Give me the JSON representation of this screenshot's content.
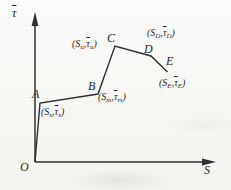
{
  "figure": {
    "ink": "#2f2f2f"
  },
  "axes": {
    "y_label": "τ",
    "x_label": "S",
    "origin_label": "O"
  },
  "curve": {
    "polyline_points": "35,162 40,103 98,94 115,46 151,56 167.5,72"
  },
  "points": [
    {
      "letter": "A",
      "coord_open": "(S",
      "coord_sub1": "s",
      "coord_comma": ",",
      "coord_tau": "τ",
      "coord_sub2": "s",
      "coord_close": ")"
    },
    {
      "letter": "B",
      "coord_open": "(S",
      "coord_sub1": "m",
      "coord_comma": ",",
      "coord_tau": "τ",
      "coord_sub2": "m",
      "coord_close": ")"
    },
    {
      "letter": "C",
      "coord_open": "(S",
      "coord_sub1": "u",
      "coord_comma": ",",
      "coord_tau": "τ",
      "coord_sub2": "u",
      "coord_close": ")"
    },
    {
      "letter": "D",
      "coord_open": "(S",
      "coord_sub1": "D",
      "coord_comma": ",",
      "coord_tau": "τ",
      "coord_sub2": "D",
      "coord_close": ")"
    },
    {
      "letter": "E",
      "coord_open": "(S",
      "coord_sub1": "E",
      "coord_comma": ",",
      "coord_tau": "τ",
      "coord_sub2": "E",
      "coord_close": ")"
    }
  ]
}
